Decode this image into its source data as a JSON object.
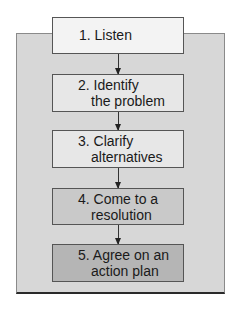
{
  "diagram": {
    "type": "flowchart",
    "orientation": "vertical",
    "steps": [
      {
        "number": "1.",
        "line1": "1. Listen",
        "line2": "",
        "fill": "#f3f3f3"
      },
      {
        "number": "2.",
        "line1": "2. Identify",
        "line2": "the problem",
        "fill": "#e7e7e7"
      },
      {
        "number": "3.",
        "line1": "3. Clarify",
        "line2": "alternatives",
        "fill": "#e7e7e7"
      },
      {
        "number": "4.",
        "line1": "4. Come to a",
        "line2": "resolution",
        "fill": "#c9c9c9"
      },
      {
        "number": "5.",
        "line1": "5. Agree on an",
        "line2": "action plan",
        "fill": "#b5b5b5"
      }
    ],
    "connectors": [
      {
        "from": 1,
        "to": 2
      },
      {
        "from": 2,
        "to": 3
      },
      {
        "from": 3,
        "to": 4
      },
      {
        "from": 4,
        "to": 5
      }
    ],
    "colors": {
      "panel": "#d7d7d7",
      "border": "#555555",
      "text": "#1a1a1a"
    }
  }
}
